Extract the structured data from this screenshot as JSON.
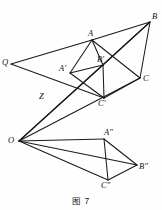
{
  "figure": {
    "caption": "图 7",
    "type": "geometry-diagram",
    "width": 162,
    "height": 210,
    "stroke_color": "#1a1a1a",
    "background_color": "#fefefe",
    "points": [
      {
        "id": "Q",
        "label": "Q",
        "x": 11,
        "y": 64,
        "label_x": 2,
        "label_y": 58
      },
      {
        "id": "A",
        "label": "A",
        "x": 92,
        "y": 40,
        "label_x": 88,
        "label_y": 29
      },
      {
        "id": "B",
        "label": "B",
        "x": 150,
        "y": 22,
        "label_x": 152,
        "label_y": 12
      },
      {
        "id": "C",
        "label": "C",
        "x": 140,
        "y": 78,
        "label_x": 143,
        "label_y": 74
      },
      {
        "id": "Ap",
        "label": "A′",
        "x": 70,
        "y": 73,
        "label_x": 59,
        "label_y": 64
      },
      {
        "id": "Bp",
        "label": "B′",
        "x": 103,
        "y": 65,
        "label_x": 97,
        "label_y": 55
      },
      {
        "id": "Cp",
        "label": "C′",
        "x": 104,
        "y": 98,
        "label_x": 98,
        "label_y": 99
      },
      {
        "id": "Z",
        "label": "Z",
        "x": 45,
        "y": 100,
        "label_x": 39,
        "label_y": 92
      },
      {
        "id": "O",
        "label": "O",
        "x": 19,
        "y": 141,
        "label_x": 8,
        "label_y": 136
      },
      {
        "id": "App",
        "label": "A″",
        "x": 104,
        "y": 139,
        "label_x": 104,
        "label_y": 128
      },
      {
        "id": "Bpp",
        "label": "B″",
        "x": 137,
        "y": 165,
        "label_x": 139,
        "label_y": 162
      },
      {
        "id": "Cpp",
        "label": "C″",
        "x": 108,
        "y": 180,
        "label_x": 101,
        "label_y": 181
      }
    ],
    "segments": [
      {
        "name": "segment-Q-A",
        "from": "Q",
        "to": "A"
      },
      {
        "name": "segment-A-B",
        "from": "A",
        "to": "B"
      },
      {
        "name": "segment-B-C",
        "from": "B",
        "to": "C"
      },
      {
        "name": "segment-A-C",
        "from": "A",
        "to": "C"
      },
      {
        "name": "segment-B-Bprime",
        "from": "B",
        "to": "Bp"
      },
      {
        "name": "segment-A-Aprime",
        "from": "A",
        "to": "Ap"
      },
      {
        "name": "segment-A-Bprime",
        "from": "A",
        "to": "Bp"
      },
      {
        "name": "segment-Aprime-Bprime",
        "from": "Ap",
        "to": "Bp"
      },
      {
        "name": "segment-Aprime-Cprime",
        "from": "Ap",
        "to": "Cp"
      },
      {
        "name": "segment-Bprime-Cprime",
        "from": "Bp",
        "to": "Cp"
      },
      {
        "name": "segment-Cprime-C",
        "from": "Cp",
        "to": "C"
      },
      {
        "name": "segment-Q-Cprime",
        "from": "Q",
        "to": "Cp"
      },
      {
        "name": "segment-O-Aprime-B",
        "from": "O",
        "to": "B"
      },
      {
        "name": "segment-O-Cprime-C",
        "from": "O",
        "to": "C"
      },
      {
        "name": "segment-O-Aprimepath",
        "from": "O",
        "to": "Bp"
      },
      {
        "name": "segment-O-Adoubleprime",
        "from": "O",
        "to": "App"
      },
      {
        "name": "segment-O-Bdoubleprime",
        "from": "O",
        "to": "Bpp"
      },
      {
        "name": "segment-O-Cdoubleprime",
        "from": "O",
        "to": "Cpp"
      },
      {
        "name": "segment-Adbl-Bdbl",
        "from": "App",
        "to": "Bpp"
      },
      {
        "name": "segment-Adbl-Cdbl",
        "from": "App",
        "to": "Cpp"
      },
      {
        "name": "segment-Bdbl-Cdbl",
        "from": "Bpp",
        "to": "Cpp"
      }
    ]
  }
}
